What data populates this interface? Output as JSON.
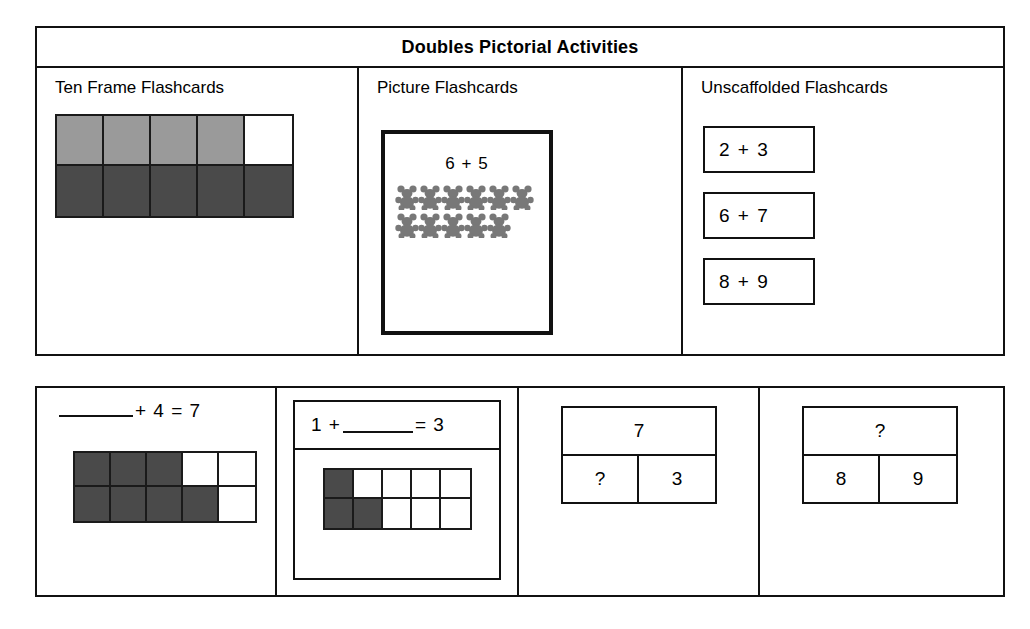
{
  "header": {
    "title": "Doubles Pictorial Activities"
  },
  "top_section": {
    "columns": [
      {
        "heading": "Ten Frame Flashcards",
        "ten_frame": {
          "rows": [
            [
              "light",
              "light",
              "light",
              "light",
              "empty"
            ],
            [
              "dark",
              "dark",
              "dark",
              "dark",
              "dark"
            ]
          ]
        }
      },
      {
        "heading": "Picture Flashcards",
        "card": {
          "equation": "6 + 5",
          "counter_icon": "teddy-bear-counter-icon",
          "rows": [
            6,
            5
          ]
        }
      },
      {
        "heading": "Unscaffolded Flashcards",
        "cards": [
          {
            "equation": "2 + 3"
          },
          {
            "equation": "6 + 7"
          },
          {
            "equation": "8 + 9"
          }
        ]
      }
    ]
  },
  "bottom_section": {
    "panels": [
      {
        "type": "equation-with-ten-frame",
        "equation_before": "",
        "equation_after": "+ 4 = 7",
        "ten_frame": {
          "rows": [
            [
              "dark",
              "dark",
              "dark",
              "empty",
              "empty"
            ],
            [
              "dark",
              "dark",
              "dark",
              "dark",
              "empty"
            ]
          ]
        }
      },
      {
        "type": "framed-equation-with-ten-frame",
        "equation_before": "1 +",
        "equation_after": "= 3",
        "ten_frame": {
          "rows": [
            [
              "dark",
              "empty",
              "empty",
              "empty",
              "empty"
            ],
            [
              "dark",
              "dark",
              "empty",
              "empty",
              "empty"
            ]
          ]
        }
      },
      {
        "type": "part-part-whole",
        "whole": "7",
        "part_left": "?",
        "part_right": "3"
      },
      {
        "type": "part-part-whole",
        "whole": "?",
        "part_left": "8",
        "part_right": "9"
      }
    ]
  },
  "colors": {
    "ink": "#111111",
    "cell_light": "#9a9a9a",
    "cell_dark": "#4a4a4a",
    "cell_empty": "#ffffff",
    "counter_gray": "#787878"
  }
}
